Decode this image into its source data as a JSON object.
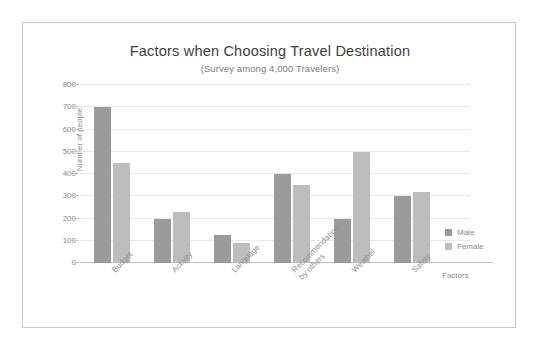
{
  "chart_data": {
    "type": "bar",
    "title": "Factors when Choosing Travel Destination",
    "subtitle": "(Survey among 4,000 Travelers)",
    "xlabel": "Factors",
    "ylabel": "Number of people",
    "ylim": [
      0,
      800
    ],
    "yticks": [
      800,
      700,
      600,
      500,
      400,
      300,
      200,
      100,
      0
    ],
    "grid": true,
    "legend_position": "right",
    "categories": [
      "Budget",
      "Activity",
      "Language",
      "Recommendation\nby others",
      "Weather",
      "Safety"
    ],
    "series": [
      {
        "name": "Male",
        "color": "#9b9b9b",
        "values": [
          700,
          200,
          125,
          400,
          200,
          300
        ]
      },
      {
        "name": "Female",
        "color": "#bdbdbd",
        "values": [
          450,
          230,
          90,
          350,
          500,
          320
        ]
      }
    ]
  },
  "frame": {
    "border_color": "#c9c9c9"
  }
}
